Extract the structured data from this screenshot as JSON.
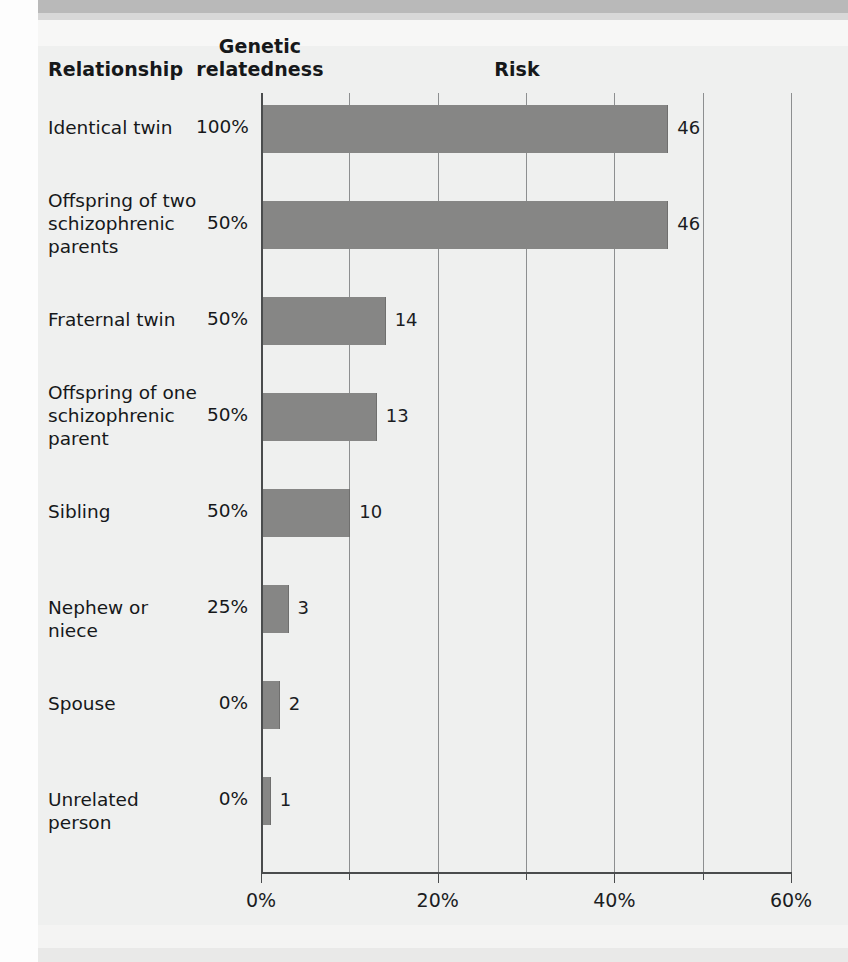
{
  "headers": {
    "relationship": "Relationship",
    "genetic_relatedness": "Genetic relatedness",
    "risk": "Risk"
  },
  "chart_data": {
    "type": "bar",
    "orientation": "horizontal",
    "title": "Risk",
    "xlabel": "",
    "ylabel": "",
    "xlim": [
      0,
      60
    ],
    "xticks": [
      0,
      20,
      40,
      60
    ],
    "xticklabels": [
      "0%",
      "20%",
      "40%",
      "60%"
    ],
    "minor_gridlines": [
      10,
      30,
      50
    ],
    "grid": true,
    "legend": null,
    "bar_color": "#868685",
    "categories": [
      "Identical twin",
      "Offspring of two schizophrenic parents",
      "Fraternal twin",
      "Offspring of one schizophrenic parent",
      "Sibling",
      "Nephew or niece",
      "Spouse",
      "Unrelated person"
    ],
    "values": [
      46,
      46,
      14,
      13,
      10,
      3,
      2,
      1
    ],
    "value_labels": [
      "46",
      "46",
      "14",
      "13",
      "10",
      "3",
      "2",
      "1"
    ],
    "genetic_relatedness": [
      "100%",
      "50%",
      "50%",
      "50%",
      "50%",
      "25%",
      "0%",
      "0%"
    ]
  },
  "rows": [
    {
      "label": "Identical twin",
      "label_lines": [
        "Identical twin"
      ],
      "relatedness": "100%",
      "risk": 46,
      "risk_label": "46"
    },
    {
      "label": "Offspring of two schizophrenic parents",
      "label_lines": [
        "Offspring of two",
        "schizophrenic",
        "parents"
      ],
      "relatedness": "50%",
      "risk": 46,
      "risk_label": "46"
    },
    {
      "label": "Fraternal twin",
      "label_lines": [
        "Fraternal twin"
      ],
      "relatedness": "50%",
      "risk": 14,
      "risk_label": "14"
    },
    {
      "label": "Offspring of one schizophrenic parent",
      "label_lines": [
        "Offspring of one",
        "schizophrenic",
        "parent"
      ],
      "relatedness": "50%",
      "risk": 13,
      "risk_label": "13"
    },
    {
      "label": "Sibling",
      "label_lines": [
        "Sibling"
      ],
      "relatedness": "50%",
      "risk": 10,
      "risk_label": "10"
    },
    {
      "label": "Nephew or niece",
      "label_lines": [
        "Nephew or niece"
      ],
      "relatedness": "25%",
      "risk": 3,
      "risk_label": "3"
    },
    {
      "label": "Spouse",
      "label_lines": [
        "Spouse"
      ],
      "relatedness": "0%",
      "risk": 2,
      "risk_label": "2"
    },
    {
      "label": "Unrelated person",
      "label_lines": [
        "Unrelated person"
      ],
      "relatedness": "0%",
      "risk": 1,
      "risk_label": "1"
    }
  ],
  "axis": {
    "labels": [
      "0%",
      "20%",
      "40%",
      "60%"
    ],
    "values": [
      0,
      20,
      40,
      60
    ],
    "minor": [
      10,
      30,
      50
    ]
  }
}
